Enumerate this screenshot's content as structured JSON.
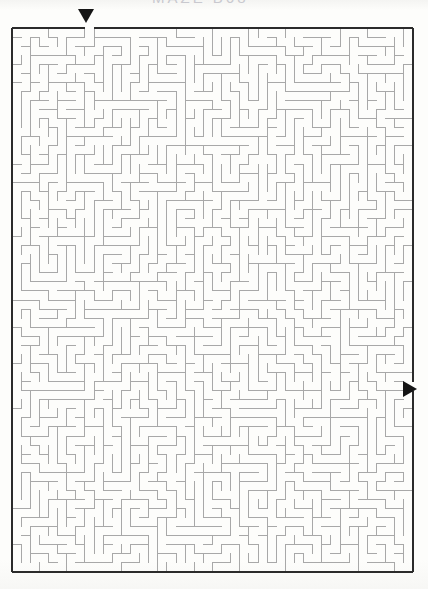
{
  "page": {
    "width": 428,
    "height": 589,
    "background_color": "#fdfdfb",
    "header_remnant_text": "MAZE   B68"
  },
  "maze": {
    "title": "Maze Puzzle",
    "x": 12,
    "y": 28,
    "width": 401,
    "height": 544,
    "columns": 44,
    "rows": 60,
    "cell_size": 9.1,
    "border_color": "#2b2b2b",
    "border_width": 2,
    "wall_color": "#a8a8a8",
    "wall_width": 1,
    "background_color": "#ffffff"
  },
  "entry": {
    "label": "entry",
    "icon": "triangle-down-icon",
    "color": "#151515",
    "column": 8,
    "side": "top",
    "x": 85,
    "y": 16
  },
  "exit": {
    "label": "exit",
    "icon": "triangle-right-icon",
    "color": "#151515",
    "row": 39,
    "side": "right",
    "x": 410,
    "y": 389
  },
  "chart_data": {
    "type": "maze",
    "grid": {
      "columns": 44,
      "rows": 60
    },
    "start": {
      "col": 8,
      "row": 0,
      "edge": "top"
    },
    "finish": {
      "col": 43,
      "row": 39,
      "edge": "right"
    },
    "seed": 68341
  }
}
